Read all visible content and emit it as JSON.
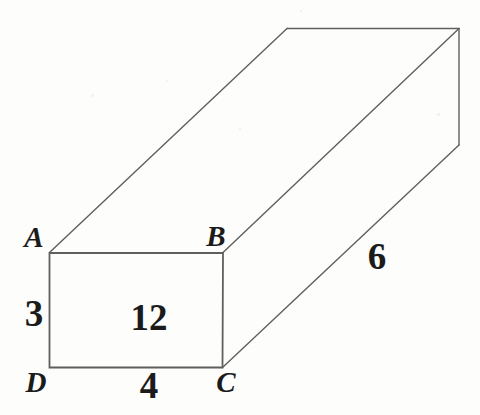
{
  "diagram": {
    "type": "rectangular-prism",
    "vertex_labels": {
      "A": "A",
      "B": "B",
      "C": "C",
      "D": "D"
    },
    "dimension_labels": {
      "height": "3",
      "front_face_value": "12",
      "width": "4",
      "depth": "6"
    },
    "colors": {
      "background": "#fdfdfc",
      "edge_line": "#5f5f5f",
      "label_text": "#1b1b1b"
    }
  }
}
